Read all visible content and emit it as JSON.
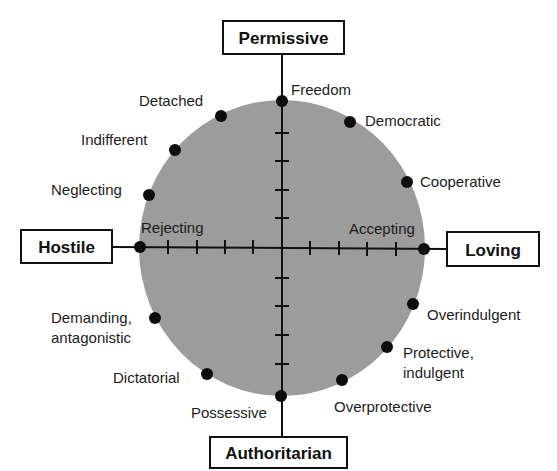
{
  "diagram": {
    "colors": {
      "circle_fill": "#9c9c9c",
      "axis": "#111111",
      "dot": "#0d0d0d",
      "box_border": "#111111",
      "text": "#1c1c1c"
    },
    "axes": {
      "top": "Permissive",
      "bottom": "Authoritarian",
      "left": "Hostile",
      "right": "Loving"
    },
    "axis_points": {
      "top": "Freedom",
      "bottom": "Possessive",
      "left": "Rejecting",
      "right": "Accepting"
    },
    "points": [
      {
        "label": "Freedom"
      },
      {
        "label": "Democratic"
      },
      {
        "label": "Cooperative"
      },
      {
        "label": "Accepting"
      },
      {
        "label": "Overindulgent"
      },
      {
        "label": "Protective,",
        "label2": "indulgent"
      },
      {
        "label": "Overprotective"
      },
      {
        "label": "Possessive"
      },
      {
        "label": "Dictatorial"
      },
      {
        "label": "Demanding,",
        "label2": "antagonistic"
      },
      {
        "label": "Rejecting"
      },
      {
        "label": "Neglecting"
      },
      {
        "label": "Indifferent"
      },
      {
        "label": "Detached"
      }
    ],
    "ticks_per_half_axis": 4
  }
}
